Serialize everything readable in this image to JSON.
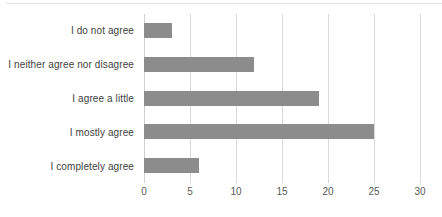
{
  "chart_data": {
    "type": "bar",
    "orientation": "horizontal",
    "title": "",
    "subtitle": "",
    "xlabel": "",
    "ylabel": "",
    "categories": [
      "I do not agree",
      "I neither agree nor disagree",
      "I agree a little",
      "I mostly agree",
      "I completely agree"
    ],
    "values": [
      3,
      12,
      19,
      25,
      6
    ],
    "series": [
      {
        "name": "",
        "values": [
          3,
          12,
          19,
          25,
          6
        ]
      }
    ],
    "xlim": [
      0,
      30
    ],
    "xticks": [
      0,
      5,
      10,
      15,
      20,
      25,
      30
    ],
    "xtick_labels": [
      "0",
      "5",
      "10",
      "15",
      "20",
      "25",
      "30"
    ],
    "grid": "vertical",
    "legend": "none",
    "bar_color": "#8c8c8c",
    "gridline_color": "#d9d9d9",
    "axis_text_color": "#3f3f3f",
    "background_color": "#ffffff"
  }
}
